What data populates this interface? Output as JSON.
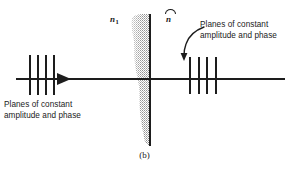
{
  "figure": {
    "caption": "(b)",
    "caption_letter": "b",
    "axis": {
      "name": "propagation-axis",
      "color": "#1d1d1d"
    },
    "labels": {
      "refractive_index": "n",
      "refractive_index_subscript": "1",
      "normal_vector": "n",
      "normal_vector_accent": "hat"
    },
    "annotations": {
      "left_text": "Planes of constant\namplitude and phase",
      "right_text": "Planes of constant\namplitude and phase"
    },
    "wavefronts": {
      "left_count": 4,
      "right_count": 4,
      "left_positions_px": [
        0,
        8,
        16,
        24
      ],
      "right_positions_px": [
        0,
        9,
        17,
        26
      ]
    },
    "interface": {
      "name": "medium-boundary",
      "color": "#1d1d1d"
    },
    "attenuation_region": {
      "name": "evanescent-attenuation-blob",
      "fill": "#9a9a9a"
    }
  }
}
